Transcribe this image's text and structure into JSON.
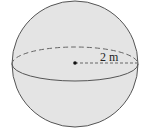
{
  "diagram": {
    "shape": "sphere",
    "radius_label": "2 m",
    "colors": {
      "fill": "#e4e4e4",
      "stroke": "#555555",
      "background": "#ffffff"
    }
  }
}
